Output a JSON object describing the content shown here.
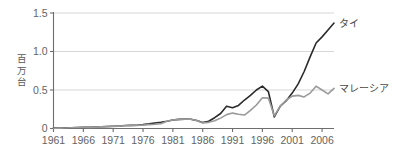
{
  "chart_data": {
    "type": "line",
    "title": "",
    "subtitle": "",
    "xlabel": "",
    "ylabel": "百万台",
    "xlim": [
      1961,
      2008
    ],
    "ylim": [
      0,
      1.5
    ],
    "grid": true,
    "gridlines_y": [
      0.5,
      1.0,
      1.5
    ],
    "legend_position": "right-inline-labels",
    "x_tick_labels": [
      "1961",
      "1966",
      "1971",
      "1976",
      "1981",
      "1986",
      "1991",
      "1996",
      "2001",
      "2006"
    ],
    "x_ticks": [
      1961,
      1966,
      1971,
      1976,
      1981,
      1986,
      1991,
      1996,
      2001,
      2006
    ],
    "y_tick_labels": [
      "0",
      "0.5",
      "1.0",
      "1.5"
    ],
    "y_ticks": [
      0,
      0.5,
      1.0,
      1.5
    ],
    "x": [
      1961,
      1962,
      1963,
      1964,
      1965,
      1966,
      1967,
      1968,
      1969,
      1970,
      1971,
      1972,
      1973,
      1974,
      1975,
      1976,
      1977,
      1978,
      1979,
      1980,
      1981,
      1982,
      1983,
      1984,
      1985,
      1986,
      1987,
      1988,
      1989,
      1990,
      1991,
      1992,
      1993,
      1994,
      1995,
      1996,
      1997,
      1998,
      1999,
      2000,
      2001,
      2002,
      2003,
      2004,
      2005,
      2006,
      2007,
      2008
    ],
    "series": [
      {
        "name": "タイ",
        "name_en": "Thailand",
        "color": "#2b2b2b",
        "label_x": 2008,
        "label_y": 1.37,
        "values": [
          0.005,
          0.006,
          0.008,
          0.01,
          0.012,
          0.014,
          0.017,
          0.02,
          0.023,
          0.026,
          0.029,
          0.033,
          0.038,
          0.04,
          0.043,
          0.05,
          0.06,
          0.072,
          0.082,
          0.095,
          0.11,
          0.118,
          0.122,
          0.12,
          0.105,
          0.078,
          0.095,
          0.14,
          0.195,
          0.29,
          0.27,
          0.3,
          0.37,
          0.43,
          0.5,
          0.55,
          0.48,
          0.15,
          0.29,
          0.36,
          0.46,
          0.58,
          0.74,
          0.93,
          1.11,
          1.19,
          1.28,
          1.37
        ]
      },
      {
        "name": "マレーシア",
        "name_en": "Malaysia",
        "color": "#9a9a9a",
        "label_x": 2008,
        "label_y": 0.52,
        "values": [
          0.004,
          0.005,
          0.007,
          0.009,
          0.011,
          0.013,
          0.015,
          0.018,
          0.021,
          0.024,
          0.027,
          0.031,
          0.035,
          0.038,
          0.041,
          0.046,
          0.05,
          0.055,
          0.062,
          0.095,
          0.11,
          0.118,
          0.122,
          0.12,
          0.105,
          0.072,
          0.08,
          0.1,
          0.135,
          0.18,
          0.2,
          0.185,
          0.175,
          0.235,
          0.305,
          0.4,
          0.395,
          0.165,
          0.29,
          0.37,
          0.42,
          0.43,
          0.41,
          0.46,
          0.55,
          0.5,
          0.45,
          0.52
        ]
      }
    ]
  }
}
